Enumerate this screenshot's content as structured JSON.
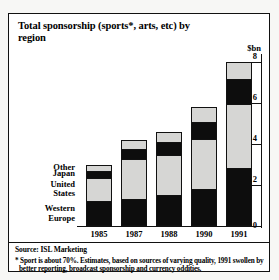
{
  "chart_data": {
    "type": "bar",
    "subtype": "stacked-bar",
    "title": "Total sponsorship (sports*, arts, etc) by region",
    "unit_label": "$bn",
    "xlabel": "",
    "ylabel": "",
    "ylim": [
      0,
      8
    ],
    "yticks": [
      0,
      2,
      4,
      6,
      8
    ],
    "ytick_labels": [
      "0",
      "2",
      "4",
      "6",
      "8"
    ],
    "grid": true,
    "axis_position": "right",
    "legend_position": "inline-left",
    "categories": [
      "1985",
      "1987",
      "1988",
      "1990",
      "1991"
    ],
    "series": [
      {
        "name": "Western Europe",
        "color": "#0d0d0d",
        "values": [
          1.2,
          1.3,
          1.5,
          1.8,
          2.8
        ]
      },
      {
        "name": "United States",
        "color": "#d6d6d4",
        "values": [
          1.2,
          2.0,
          2.0,
          2.5,
          3.2
        ]
      },
      {
        "name": "Japan",
        "color": "#0d0d0d",
        "values": [
          0.3,
          0.5,
          0.6,
          0.8,
          1.2
        ]
      },
      {
        "name": "Other",
        "color": "#d6d6d4",
        "values": [
          0.3,
          0.4,
          0.5,
          0.7,
          0.8
        ]
      }
    ],
    "totals": [
      3.0,
      4.2,
      4.6,
      5.8,
      8.0
    ],
    "source": "Source: ISL Marketing",
    "footnote": "* Sport is about 70%. Estimates, based on sources of varying quality, 1991 swollen by better reporting, broadcast sponsorship and currency oddities."
  },
  "colors": {
    "dark": "#0d0d0d",
    "light": "#d6d6d4",
    "frame": "#111111",
    "page": "#f7f7f5",
    "panel": "#ffffff"
  }
}
